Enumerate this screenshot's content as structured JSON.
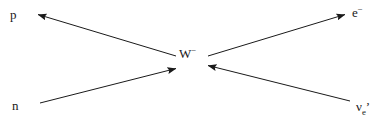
{
  "diagram": {
    "type": "feynman-diagram",
    "canvas": {
      "width": 384,
      "height": 128,
      "background": "#ffffff"
    },
    "line_color": "#1a1a1a",
    "line_width": 1,
    "vertex": {
      "x": 192,
      "y": 64
    },
    "mediator": {
      "name": "w-boson",
      "base": "W",
      "charge": "−",
      "text": "W⁻"
    },
    "labels": {
      "proton": {
        "text": "p",
        "name": "proton-label"
      },
      "neutron": {
        "text": "n",
        "name": "neutron-label"
      },
      "electron": {
        "base": "e",
        "charge": "−",
        "text": "e⁻",
        "name": "electron-label"
      },
      "antineutrino": {
        "base": "ν",
        "subscript": "e",
        "prime": "’",
        "text": "νₑ’",
        "name": "electron-antineutrino-label"
      }
    },
    "lines": [
      {
        "name": "proton-line",
        "from_particle": "W⁻",
        "to_particle": "p",
        "direction": "outgoing-up-left",
        "arrowhead_at": "end",
        "x1": 176,
        "y1": 56,
        "x2": 36,
        "y2": 14
      },
      {
        "name": "neutron-line",
        "from_particle": "n",
        "to_particle": "W⁻",
        "direction": "incoming-from-lower-left",
        "arrowhead_at": "end",
        "x1": 40,
        "y1": 103,
        "x2": 178,
        "y2": 68
      },
      {
        "name": "electron-line",
        "from_particle": "W⁻",
        "to_particle": "e⁻",
        "direction": "outgoing-up-right",
        "arrowhead_at": "end",
        "x1": 208,
        "y1": 56,
        "x2": 347,
        "y2": 14
      },
      {
        "name": "antineutrino-line",
        "from_particle": "νₑ’",
        "to_particle": "W⁻",
        "direction": "incoming-from-lower-right",
        "arrowhead_at": "end",
        "x1": 350,
        "y1": 101,
        "x2": 206,
        "y2": 66
      }
    ]
  }
}
